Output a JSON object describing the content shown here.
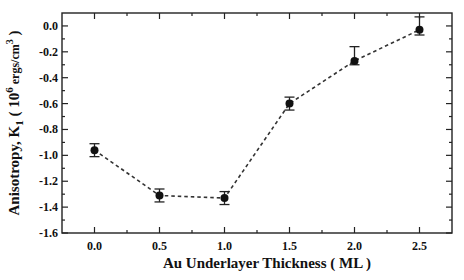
{
  "chart_data": {
    "type": "line",
    "title": "",
    "xlabel": "Au Underlayer Thickness ( ML )",
    "ylabel": {
      "prefix": "Anisotropy, K",
      "sub": "1",
      "mid": " ( 10",
      "sup": "6",
      "unit": " ergs/cm",
      "unit_sup": "3",
      "suffix": " )"
    },
    "xlim": [
      -0.25,
      2.75
    ],
    "ylim": [
      -1.6,
      0.1
    ],
    "x_ticks": [
      0.0,
      0.5,
      1.0,
      1.5,
      2.0,
      2.5
    ],
    "x_tick_labels": [
      "0.0",
      "0.5",
      "1.0",
      "1.5",
      "2.0",
      "2.5"
    ],
    "y_ticks": [
      0.0,
      -0.2,
      -0.4,
      -0.6,
      -0.8,
      -1.0,
      -1.2,
      -1.4,
      -1.6
    ],
    "y_tick_labels": [
      "0.0",
      "-0.2",
      "-0.4",
      "-0.6",
      "-0.8",
      "-1.0",
      "-1.2",
      "-1.4",
      "-1.6"
    ],
    "grid": false,
    "legend": "none",
    "series": [
      {
        "name": "K1",
        "line_style": "dashed",
        "marker": "filled-circle",
        "x": [
          0.0,
          0.5,
          1.0,
          1.5,
          2.0,
          2.5
        ],
        "y": [
          -0.96,
          -1.31,
          -1.33,
          -0.6,
          -0.27,
          -0.03
        ],
        "err_plus": [
          0.05,
          0.05,
          0.05,
          0.05,
          0.11,
          0.1
        ],
        "err_minus": [
          0.05,
          0.05,
          0.05,
          0.05,
          0.03,
          0.04
        ]
      }
    ]
  }
}
